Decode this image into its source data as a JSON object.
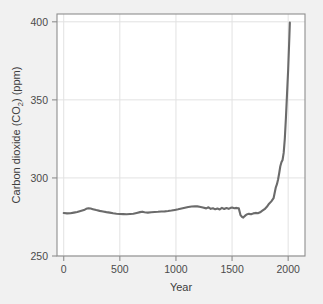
{
  "figure": {
    "background_color": "#f1f1f1",
    "plot_background_color": "#ffffff",
    "line_color": "#6b6b6b",
    "grid_color": "#e2e2e2",
    "axis_color": "#808080",
    "text_color": "#4b4b4b"
  },
  "axes": {
    "x_title": "Year",
    "y_title_main": "Carbon dioxide (CO",
    "y_title_sub": "2",
    "y_title_tail": ") (ppm)",
    "y_title_full": "Carbon dioxide (CO2) (ppm)",
    "x_ticks": [
      "0",
      "500",
      "1000",
      "1500",
      "2000"
    ],
    "y_ticks": [
      "250",
      "300",
      "350",
      "400"
    ]
  },
  "chart_data": {
    "type": "line",
    "title": "",
    "xlabel": "Year",
    "ylabel": "Carbon dioxide (CO2) (ppm)",
    "xlim": [
      -60,
      2150
    ],
    "ylim": [
      250,
      405
    ],
    "xticks": [
      0,
      500,
      1000,
      1500,
      2000
    ],
    "yticks": [
      250,
      300,
      350,
      400
    ],
    "grid": true,
    "legend": "none",
    "series": [
      {
        "name": "Atmospheric CO2 concentration",
        "color": "#6b6b6b",
        "x": [
          0,
          30,
          60,
          90,
          120,
          150,
          180,
          200,
          220,
          240,
          260,
          290,
          320,
          350,
          380,
          410,
          440,
          470,
          500,
          530,
          560,
          590,
          620,
          650,
          680,
          700,
          720,
          750,
          780,
          810,
          840,
          870,
          900,
          930,
          960,
          990,
          1020,
          1050,
          1080,
          1110,
          1140,
          1170,
          1190,
          1210,
          1240,
          1270,
          1290,
          1310,
          1330,
          1350,
          1370,
          1390,
          1410,
          1430,
          1450,
          1470,
          1490,
          1500,
          1520,
          1540,
          1560,
          1575,
          1590,
          1600,
          1610,
          1620,
          1630,
          1650,
          1670,
          1690,
          1710,
          1730,
          1750,
          1770,
          1790,
          1810,
          1830,
          1850,
          1870,
          1890,
          1900,
          1910,
          1920,
          1930,
          1940,
          1950,
          1960,
          1970,
          1980,
          1990,
          2000,
          2010,
          2015
        ],
        "y": [
          277.5,
          277.3,
          277.4,
          277.8,
          278.2,
          278.8,
          279.4,
          280.2,
          280.6,
          280.4,
          280.0,
          279.4,
          278.9,
          278.5,
          278.1,
          277.8,
          277.4,
          277.1,
          276.9,
          276.8,
          276.7,
          276.9,
          277.1,
          277.6,
          278.1,
          278.4,
          278.0,
          277.8,
          278.0,
          278.2,
          278.3,
          278.5,
          278.6,
          278.8,
          279.1,
          279.5,
          279.9,
          280.4,
          280.9,
          281.4,
          281.7,
          281.9,
          281.8,
          281.5,
          281.0,
          280.5,
          281.2,
          280.2,
          280.6,
          279.9,
          280.4,
          279.8,
          280.8,
          280.1,
          280.7,
          280.2,
          280.9,
          281.0,
          280.6,
          280.8,
          280.5,
          276.2,
          275.0,
          274.6,
          275.4,
          276.0,
          276.6,
          277.0,
          276.7,
          277.3,
          277.6,
          277.4,
          278.0,
          279.0,
          280.0,
          281.5,
          283.5,
          285.0,
          287.0,
          294.0,
          296.0,
          299.0,
          303.0,
          307.5,
          310.0,
          311.5,
          316.0,
          325.0,
          338.5,
          354.0,
          369.5,
          389.0,
          399.5
        ]
      }
    ]
  }
}
